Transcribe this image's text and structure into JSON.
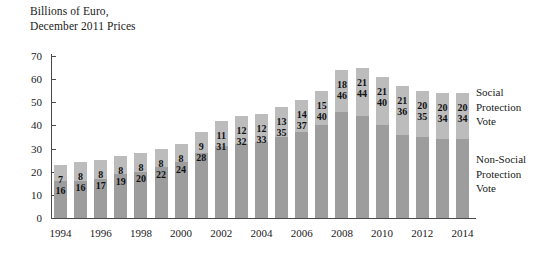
{
  "chart_data": {
    "type": "bar",
    "subtype": "stacked-vertical",
    "title": "Billions of Euro,\nDecember 2011 Prices",
    "xlabel": "",
    "ylabel": "Billions of Euro, December 2011 Prices",
    "ylim": [
      0,
      70
    ],
    "yticks": [
      0,
      10,
      20,
      30,
      40,
      50,
      60,
      70
    ],
    "grid": false,
    "legend_position": "right",
    "categories": [
      "1994",
      "1995",
      "1996",
      "1997",
      "1998",
      "1999",
      "2000",
      "2001",
      "2002",
      "2003",
      "2004",
      "2005",
      "2006",
      "2007",
      "2008",
      "2009",
      "2010",
      "2011",
      "2012",
      "2013",
      "2014"
    ],
    "xtick_labels": [
      "1994",
      "1996",
      "1998",
      "2000",
      "2002",
      "2004",
      "2006",
      "2008",
      "2010",
      "2012",
      "2014"
    ],
    "series": [
      {
        "name": "Non-Social Protection Vote",
        "color": "#9d9d9d",
        "values": [
          16,
          16,
          17,
          19,
          20,
          22,
          24,
          28,
          31,
          32,
          33,
          35,
          37,
          40,
          46,
          44,
          40,
          36,
          35,
          34,
          34
        ]
      },
      {
        "name": "Social Protection Vote",
        "color": "#bcbcbc",
        "values": [
          7,
          8,
          8,
          8,
          8,
          8,
          8,
          9,
          11,
          12,
          12,
          13,
          14,
          15,
          18,
          21,
          21,
          21,
          20,
          20,
          20
        ]
      }
    ],
    "totals": [
      23,
      24,
      25,
      27,
      28,
      30,
      32,
      37,
      42,
      44,
      45,
      48,
      51,
      55,
      64,
      65,
      61,
      57,
      55,
      54,
      54
    ]
  },
  "legend": {
    "social": "Social\nProtection\nVote",
    "non_social": "Non-Social\nProtection\nVote"
  }
}
